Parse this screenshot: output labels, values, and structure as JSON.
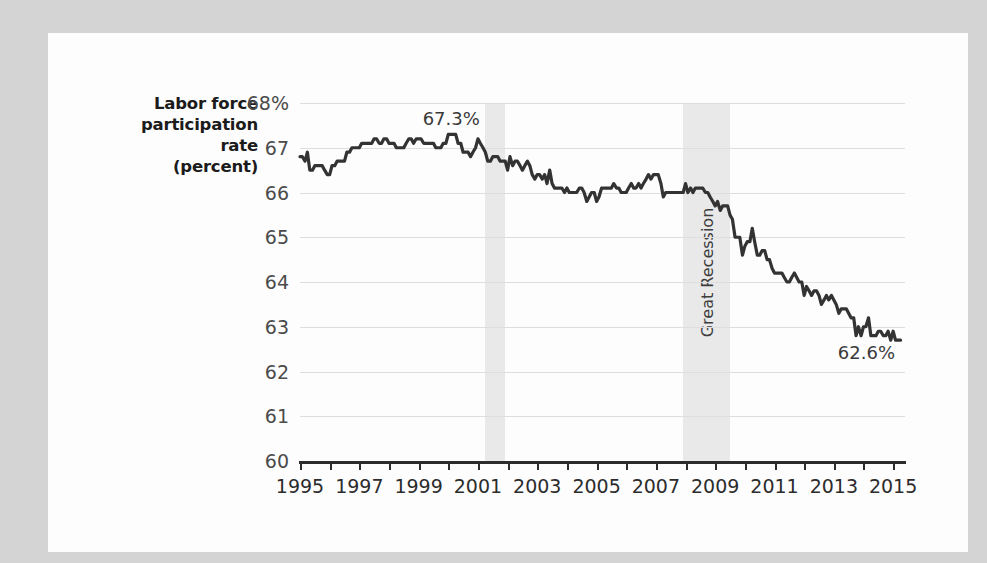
{
  "figure": {
    "background_color": "#d4d4d4",
    "panel_color": "#fdfdfd",
    "line_color": "#333333",
    "grid_color": "#dedede",
    "band_color": "#e9e9e9"
  },
  "chart_data": {
    "type": "line",
    "title": "",
    "subtitle": "",
    "xlabel": "",
    "ylabel": "Labor force participation rate (percent)",
    "ylabel_lines": [
      "Labor force",
      "participation",
      "rate",
      "(percent)"
    ],
    "xlim": [
      1995.0,
      2015.4
    ],
    "ylim": [
      60,
      68
    ],
    "grid": true,
    "legend": "none",
    "ytick_labels": [
      "68%",
      "67",
      "66",
      "65",
      "64",
      "63",
      "62",
      "61",
      "60"
    ],
    "ytick_values": [
      68,
      67,
      66,
      65,
      64,
      63,
      62,
      61,
      60
    ],
    "xtick_labels": [
      "1995",
      "1997",
      "1999",
      "2001",
      "2003",
      "2005",
      "2007",
      "2009",
      "2011",
      "2013",
      "2015"
    ],
    "xtick_values": [
      1995,
      1997,
      1999,
      2001,
      2003,
      2005,
      2007,
      2009,
      2011,
      2013,
      2015
    ],
    "xtick_minor_values": [
      1996,
      1998,
      2000,
      2002,
      2004,
      2006,
      2008,
      2010,
      2012,
      2014
    ],
    "annotations": [
      {
        "text": "67.3%",
        "x": 2000.1,
        "y": 67.62,
        "name": "peak-value-label"
      },
      {
        "text": "62.6%",
        "x": 2014.1,
        "y": 62.38,
        "name": "latest-value-label"
      }
    ],
    "shaded_regions": [
      {
        "label": "",
        "x0": 2001.25,
        "x1": 2001.92,
        "name": "recession-2001-band"
      },
      {
        "label": "Great Recession",
        "x0": 2007.92,
        "x1": 2009.5,
        "name": "great-recession-band"
      }
    ],
    "series": [
      {
        "name": "Labor force participation rate",
        "x": [
          1995.0,
          1995.08,
          1995.17,
          1995.25,
          1995.33,
          1995.42,
          1995.5,
          1995.58,
          1995.67,
          1995.75,
          1995.83,
          1995.92,
          1996.0,
          1996.08,
          1996.17,
          1996.25,
          1996.33,
          1996.42,
          1996.5,
          1996.58,
          1996.67,
          1996.75,
          1996.83,
          1996.92,
          1997.0,
          1997.08,
          1997.17,
          1997.25,
          1997.33,
          1997.42,
          1997.5,
          1997.58,
          1997.67,
          1997.75,
          1997.83,
          1997.92,
          1998.0,
          1998.08,
          1998.17,
          1998.25,
          1998.33,
          1998.42,
          1998.5,
          1998.58,
          1998.67,
          1998.75,
          1998.83,
          1998.92,
          1999.0,
          1999.08,
          1999.17,
          1999.25,
          1999.33,
          1999.42,
          1999.5,
          1999.58,
          1999.67,
          1999.75,
          1999.83,
          1999.92,
          2000.0,
          2000.08,
          2000.17,
          2000.25,
          2000.33,
          2000.42,
          2000.5,
          2000.58,
          2000.67,
          2000.75,
          2000.83,
          2000.92,
          2001.0,
          2001.08,
          2001.17,
          2001.25,
          2001.33,
          2001.42,
          2001.5,
          2001.58,
          2001.67,
          2001.75,
          2001.83,
          2001.92,
          2002.0,
          2002.08,
          2002.17,
          2002.25,
          2002.33,
          2002.42,
          2002.5,
          2002.58,
          2002.67,
          2002.75,
          2002.83,
          2002.92,
          2003.0,
          2003.08,
          2003.17,
          2003.25,
          2003.33,
          2003.42,
          2003.5,
          2003.58,
          2003.67,
          2003.75,
          2003.83,
          2003.92,
          2004.0,
          2004.08,
          2004.17,
          2004.25,
          2004.33,
          2004.42,
          2004.5,
          2004.58,
          2004.67,
          2004.75,
          2004.83,
          2004.92,
          2005.0,
          2005.08,
          2005.17,
          2005.25,
          2005.33,
          2005.42,
          2005.5,
          2005.58,
          2005.67,
          2005.75,
          2005.83,
          2005.92,
          2006.0,
          2006.08,
          2006.17,
          2006.25,
          2006.33,
          2006.42,
          2006.5,
          2006.58,
          2006.67,
          2006.75,
          2006.83,
          2006.92,
          2007.0,
          2007.08,
          2007.17,
          2007.25,
          2007.33,
          2007.42,
          2007.5,
          2007.58,
          2007.67,
          2007.75,
          2007.83,
          2007.92,
          2008.0,
          2008.08,
          2008.17,
          2008.25,
          2008.33,
          2008.42,
          2008.5,
          2008.58,
          2008.67,
          2008.75,
          2008.83,
          2008.92,
          2009.0,
          2009.08,
          2009.17,
          2009.25,
          2009.33,
          2009.42,
          2009.5,
          2009.58,
          2009.67,
          2009.75,
          2009.83,
          2009.92,
          2010.0,
          2010.08,
          2010.17,
          2010.25,
          2010.33,
          2010.42,
          2010.5,
          2010.58,
          2010.67,
          2010.75,
          2010.83,
          2010.92,
          2011.0,
          2011.08,
          2011.17,
          2011.25,
          2011.33,
          2011.42,
          2011.5,
          2011.58,
          2011.67,
          2011.75,
          2011.83,
          2011.92,
          2012.0,
          2012.08,
          2012.17,
          2012.25,
          2012.33,
          2012.42,
          2012.5,
          2012.58,
          2012.67,
          2012.75,
          2012.83,
          2012.92,
          2013.0,
          2013.08,
          2013.17,
          2013.25,
          2013.33,
          2013.42,
          2013.5,
          2013.58,
          2013.67,
          2013.75,
          2013.83,
          2013.92,
          2014.0,
          2014.08,
          2014.17,
          2014.25,
          2014.33,
          2014.42,
          2014.5,
          2014.58,
          2014.67,
          2014.75,
          2014.83,
          2014.92,
          2015.0,
          2015.08,
          2015.17,
          2015.25
        ],
        "y": [
          66.8,
          66.8,
          66.7,
          66.9,
          66.5,
          66.5,
          66.6,
          66.6,
          66.6,
          66.6,
          66.5,
          66.4,
          66.4,
          66.6,
          66.6,
          66.7,
          66.7,
          66.7,
          66.7,
          66.9,
          66.9,
          67.0,
          67.0,
          67.0,
          67.0,
          67.1,
          67.1,
          67.1,
          67.1,
          67.1,
          67.2,
          67.2,
          67.1,
          67.1,
          67.2,
          67.2,
          67.1,
          67.1,
          67.1,
          67.0,
          67.0,
          67.0,
          67.0,
          67.1,
          67.2,
          67.2,
          67.1,
          67.2,
          67.2,
          67.2,
          67.1,
          67.1,
          67.1,
          67.1,
          67.1,
          67.0,
          67.0,
          67.0,
          67.1,
          67.1,
          67.3,
          67.3,
          67.3,
          67.3,
          67.1,
          67.1,
          66.9,
          66.9,
          66.9,
          66.8,
          66.9,
          67.0,
          67.2,
          67.1,
          67.0,
          66.9,
          66.7,
          66.7,
          66.8,
          66.8,
          66.8,
          66.7,
          66.7,
          66.7,
          66.5,
          66.8,
          66.6,
          66.7,
          66.7,
          66.6,
          66.5,
          66.6,
          66.7,
          66.6,
          66.4,
          66.3,
          66.4,
          66.4,
          66.3,
          66.4,
          66.2,
          66.5,
          66.2,
          66.1,
          66.1,
          66.1,
          66.1,
          66.0,
          66.1,
          66.0,
          66.0,
          66.0,
          66.0,
          66.1,
          66.1,
          66.0,
          65.8,
          65.9,
          66.0,
          66.0,
          65.8,
          65.9,
          66.1,
          66.1,
          66.1,
          66.1,
          66.1,
          66.2,
          66.1,
          66.1,
          66.0,
          66.0,
          66.0,
          66.1,
          66.2,
          66.1,
          66.1,
          66.2,
          66.1,
          66.2,
          66.3,
          66.4,
          66.3,
          66.4,
          66.4,
          66.4,
          66.2,
          65.9,
          66.0,
          66.0,
          66.0,
          66.0,
          66.0,
          66.0,
          66.0,
          66.0,
          66.2,
          66.0,
          66.1,
          66.0,
          66.1,
          66.1,
          66.1,
          66.1,
          66.0,
          66.0,
          65.9,
          65.8,
          65.7,
          65.8,
          65.6,
          65.7,
          65.7,
          65.7,
          65.5,
          65.4,
          65.0,
          65.0,
          65.0,
          64.6,
          64.8,
          64.9,
          64.9,
          65.2,
          64.9,
          64.6,
          64.6,
          64.7,
          64.7,
          64.5,
          64.5,
          64.3,
          64.2,
          64.2,
          64.2,
          64.2,
          64.1,
          64.0,
          64.0,
          64.1,
          64.2,
          64.1,
          64.0,
          64.0,
          63.7,
          63.9,
          63.8,
          63.7,
          63.8,
          63.8,
          63.7,
          63.5,
          63.6,
          63.7,
          63.6,
          63.7,
          63.6,
          63.5,
          63.3,
          63.4,
          63.4,
          63.4,
          63.3,
          63.2,
          63.2,
          62.8,
          63.0,
          62.8,
          63.0,
          63.0,
          63.2,
          62.8,
          62.8,
          62.8,
          62.9,
          62.9,
          62.8,
          62.8,
          62.9,
          62.7,
          62.9,
          62.7,
          62.7,
          62.7
        ],
        "last_value": 62.7,
        "peak_value": 67.3,
        "peak_year": 2000
      }
    ]
  }
}
